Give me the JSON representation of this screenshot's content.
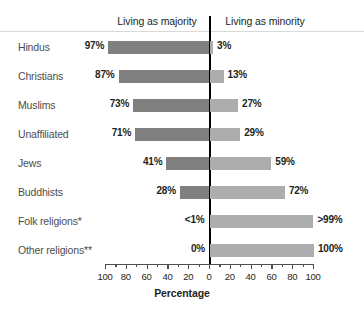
{
  "chart_data": {
    "type": "bar",
    "title": "",
    "subtitle": "",
    "orientation": "horizontal-diverging",
    "xlabel": "Percentage",
    "ylabel": "",
    "xlim": [
      -100,
      100
    ],
    "grid": false,
    "legend_position": "top",
    "categories": [
      "Hindus",
      "Christians",
      "Muslims",
      "Unaffiliated",
      "Jews",
      "Buddhists",
      "Folk religions*",
      "Other religions**"
    ],
    "series": [
      {
        "name": "Living as majority",
        "color": "#808080",
        "side": "left",
        "values": [
          97,
          87,
          73,
          71,
          41,
          28,
          0.5,
          0
        ],
        "labels": [
          "97%",
          "87%",
          "73%",
          "71%",
          "41%",
          "28%",
          "<1%",
          "0%"
        ]
      },
      {
        "name": "Living as minority",
        "color": "#adadad",
        "side": "right",
        "values": [
          3,
          13,
          27,
          29,
          59,
          72,
          99.5,
          100
        ],
        "labels": [
          "3%",
          "13%",
          "27%",
          "29%",
          "59%",
          "72%",
          ">99%",
          "100%"
        ]
      }
    ],
    "xticks": [
      100,
      80,
      60,
      40,
      20,
      0,
      20,
      40,
      60,
      80,
      100
    ],
    "xtick_values": [
      -100,
      -80,
      -60,
      -40,
      -20,
      0,
      20,
      40,
      60,
      80,
      100
    ],
    "xtick_labels": [
      "100",
      "80",
      "60",
      "40",
      "20",
      "0",
      "20",
      "40",
      "60",
      "80",
      "100"
    ]
  },
  "headers": {
    "majority": "Living as majority",
    "minority": "Living as minority"
  },
  "axis": {
    "title": "Percentage"
  },
  "colors": {
    "majority_bar": "#808080",
    "minority_bar": "#adadad",
    "zero_line": "#000000",
    "axis": "#4d4d4d",
    "text": "#231f20",
    "category_text": "#4d4d4d",
    "background": "#ffffff"
  }
}
